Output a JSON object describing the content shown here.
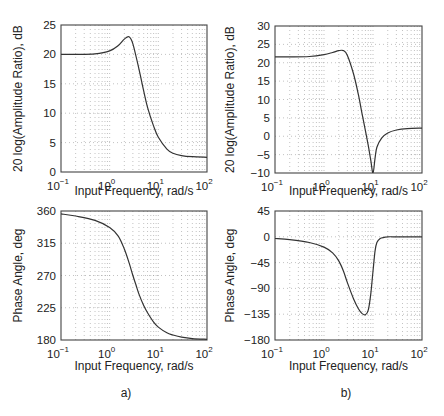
{
  "chart_data": [
    {
      "id": "a_mag",
      "panel": "a)",
      "type": "line",
      "xscale": "log",
      "xlabel": "Input Frequency, rad/s",
      "ylabel": "20 log(Amplitude Ratio), dB",
      "xlim": [
        0.1,
        100
      ],
      "ylim": [
        0,
        25
      ],
      "xticks": [
        "10^-1",
        "10^0",
        "10^1",
        "10^2"
      ],
      "yticks": [
        0,
        5,
        10,
        15,
        20,
        25
      ],
      "grid": true,
      "x": [
        0.1,
        0.2,
        0.5,
        1.0,
        1.5,
        2.0,
        2.5,
        3.0,
        4.0,
        5.0,
        6.0,
        8.0,
        10,
        15,
        20,
        30,
        50,
        100
      ],
      "values": [
        20.0,
        20.0,
        20.1,
        20.6,
        21.5,
        22.6,
        23.0,
        21.8,
        17.5,
        13.8,
        11.0,
        7.8,
        5.9,
        3.9,
        3.2,
        2.8,
        2.6,
        2.5
      ]
    },
    {
      "id": "b_mag",
      "panel": "b)",
      "type": "line",
      "xscale": "log",
      "xlabel": "Input Frequency, rad/s",
      "ylabel": "20 log(Amplitude Ratio), dB",
      "xlim": [
        0.1,
        100
      ],
      "ylim": [
        -10,
        30
      ],
      "xticks": [
        "10^-1",
        "10^0",
        "10^1",
        "10^2"
      ],
      "yticks": [
        -10,
        -5,
        0,
        5,
        10,
        15,
        20,
        25,
        30
      ],
      "grid": true,
      "x": [
        0.1,
        0.2,
        0.5,
        1.0,
        1.5,
        2.0,
        2.5,
        3.0,
        4.0,
        5.0,
        6.0,
        7.0,
        8.0,
        9.0,
        10,
        11,
        12,
        15,
        20,
        30,
        50,
        100
      ],
      "values": [
        21.6,
        21.6,
        21.7,
        22.2,
        22.8,
        23.3,
        23.3,
        22.0,
        17.0,
        11.5,
        6.0,
        1.5,
        -2.5,
        -6.5,
        -10.0,
        -6.0,
        -3.0,
        -0.5,
        0.9,
        1.7,
        2.1,
        2.2
      ]
    },
    {
      "id": "a_phase",
      "panel": "a)",
      "type": "line",
      "xscale": "log",
      "xlabel": "Input Frequency, rad/s",
      "ylabel": "Phase Angle, deg",
      "xlim": [
        0.1,
        100
      ],
      "ylim": [
        180,
        360
      ],
      "xticks": [
        "10^-1",
        "10^0",
        "10^1",
        "10^2"
      ],
      "yticks": [
        180,
        225,
        270,
        315,
        360
      ],
      "grid": true,
      "x": [
        0.1,
        0.2,
        0.5,
        1.0,
        1.5,
        2.0,
        2.5,
        3.0,
        3.5,
        4.0,
        5.0,
        6.0,
        8.0,
        10,
        15,
        20,
        30,
        50,
        100
      ],
      "values": [
        356,
        353,
        347,
        337,
        325,
        307,
        288,
        270,
        256,
        244,
        228,
        218,
        205,
        198,
        190,
        187,
        184,
        182,
        181
      ]
    },
    {
      "id": "b_phase",
      "panel": "b)",
      "type": "line",
      "xscale": "log",
      "xlabel": "Input Frequency, rad/s",
      "ylabel": "Phase Angle, deg",
      "xlim": [
        0.1,
        100
      ],
      "ylim": [
        -180,
        45
      ],
      "xticks": [
        "10^-1",
        "10^0",
        "10^1",
        "10^2"
      ],
      "yticks": [
        -180,
        -135,
        -90,
        -45,
        0,
        45
      ],
      "grid": true,
      "x": [
        0.1,
        0.2,
        0.5,
        1.0,
        1.5,
        2.0,
        2.5,
        3.0,
        4.0,
        5.0,
        6.0,
        7.0,
        8.0,
        9.0,
        10,
        11,
        12,
        14,
        17,
        20,
        30,
        50,
        100
      ],
      "values": [
        -3,
        -5,
        -10,
        -18,
        -28,
        -42,
        -60,
        -80,
        -108,
        -125,
        -134,
        -136,
        -128,
        -100,
        -60,
        -25,
        -10,
        -3,
        -1,
        0,
        0,
        0,
        0
      ]
    }
  ],
  "labels": {
    "xlabel": "Input Frequency, rad/s",
    "mag_ylabel": "20 log(Amplitude Ratio), dB",
    "phase_ylabel": "Phase Angle, deg",
    "panel_a": "a)",
    "panel_b": "b)"
  },
  "colors": {
    "curve": "#333333",
    "frame": "#444444",
    "grid": "#999999"
  }
}
